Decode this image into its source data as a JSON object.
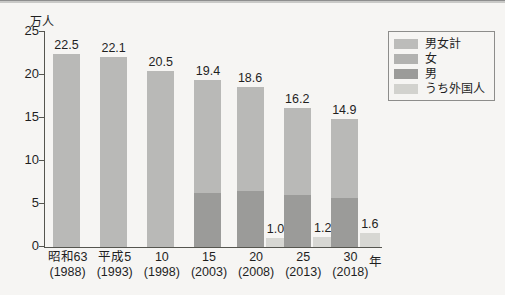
{
  "chart_data": {
    "type": "bar",
    "title": "",
    "subtitle": "",
    "unit_label": "万人",
    "xlabel": "年",
    "ylabel": "",
    "ylim": [
      0,
      25
    ],
    "yticks": [
      "0",
      "5",
      "10",
      "15",
      "20",
      "25"
    ],
    "grid": false,
    "legend_position": "top-right",
    "categories": [
      "昭和63",
      "平成5",
      "10",
      "15",
      "20",
      "25",
      "30"
    ],
    "category_years": [
      "(1988)",
      "(1993)",
      "(1998)",
      "(2003)",
      "(2008)",
      "(2013)",
      "(2018)"
    ],
    "series": [
      {
        "name": "男女計",
        "color": "#b9b9b7",
        "values": [
          22.5,
          22.1,
          20.5,
          19.4,
          18.6,
          16.2,
          14.9
        ],
        "labels": [
          "22.5",
          "22.1",
          "20.5",
          "19.4",
          "18.6",
          "16.2",
          "14.9"
        ]
      },
      {
        "name": "男",
        "color": "#9b9b99",
        "values": [
          0,
          0,
          0,
          6.3,
          6.5,
          6.0,
          5.7
        ],
        "labels": [
          "",
          "",
          "",
          "",
          "",
          "",
          ""
        ]
      },
      {
        "name": "うち外国人",
        "color": "#d7d7d3",
        "values": [
          null,
          null,
          null,
          null,
          1.0,
          1.2,
          1.6
        ],
        "labels": [
          "",
          "",
          "",
          "",
          "1.0",
          "1.2",
          "1.6"
        ]
      }
    ]
  },
  "legend": {
    "items": [
      {
        "label": "男女計",
        "color": "#bcbcba"
      },
      {
        "label": "女",
        "color": "#b2b2b0"
      },
      {
        "label": "男",
        "color": "#9b9b99"
      },
      {
        "label": "うち外国人",
        "color": "#d2d2ce"
      }
    ]
  },
  "axis": {
    "unit": "万人",
    "x_unit": "年"
  }
}
